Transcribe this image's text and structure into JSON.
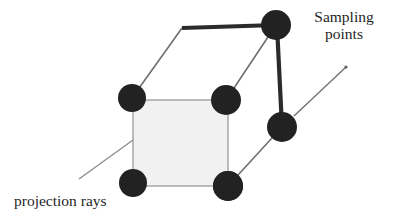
{
  "figure": {
    "kind": "line-diagram",
    "canvas": {
      "width": 394,
      "height": 224,
      "background": "#ffffff"
    }
  },
  "labels": {
    "sampling_points": {
      "line1": "Sampling",
      "line2": "points"
    },
    "projection_rays": "projection rays"
  },
  "colors": {
    "node_fill": "#222222",
    "node_stroke": "#222222",
    "thick_edge": "#262626",
    "thin_edge": "#8e8e8e",
    "face_fill": "#f1f1f1",
    "face_stroke": "#9a9a9a",
    "leader_line": "#6e6e6e",
    "text": "#1f1f1f",
    "background": "#ffffff"
  },
  "geometry": {
    "sampling_points": [
      {
        "id": "top-back-left",
        "cx": 182,
        "cy": 28,
        "r": 14
      },
      {
        "id": "top-back-right",
        "cx": 276,
        "cy": 25,
        "r": 15
      },
      {
        "id": "top-front-left",
        "cx": 132,
        "cy": 98,
        "r": 14
      },
      {
        "id": "top-front-right",
        "cx": 226,
        "cy": 100,
        "r": 15
      },
      {
        "id": "bottom-back-right",
        "cx": 282,
        "cy": 127,
        "r": 15
      },
      {
        "id": "bottom-front-left",
        "cx": 133,
        "cy": 183,
        "r": 14
      },
      {
        "id": "bottom-front-right",
        "cx": 228,
        "cy": 186,
        "r": 15
      }
    ],
    "front_face": {
      "x": 133,
      "y": 100,
      "width": 95,
      "height": 86
    },
    "thick_edges": [
      {
        "id": "top-back-edge",
        "x1": 182,
        "y1": 28,
        "x2": 276,
        "y2": 25
      },
      {
        "id": "right-back-edge",
        "x1": 277,
        "y1": 26,
        "x2": 282,
        "y2": 127
      }
    ],
    "thin_edges": [
      {
        "id": "top-left-diagonal",
        "x1": 182,
        "y1": 28,
        "x2": 132,
        "y2": 98
      },
      {
        "id": "top-right-diagonal",
        "x1": 276,
        "y1": 25,
        "x2": 226,
        "y2": 100
      },
      {
        "id": "bottom-right-diagonal",
        "x1": 282,
        "y1": 127,
        "x2": 228,
        "y2": 186
      }
    ],
    "projection_ray": {
      "x1": 79,
      "y1": 179,
      "x2": 133,
      "y2": 140
    },
    "leader_line": {
      "x1": 294,
      "y1": 116,
      "x2": 346,
      "y2": 67
    }
  }
}
